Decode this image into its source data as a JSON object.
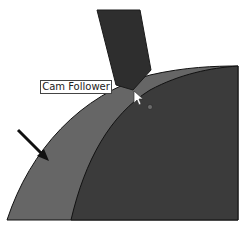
{
  "figure": {
    "tooltip_label": "Cam Follower",
    "parts": [
      {
        "name": "cam-follower",
        "shape": "slanted bar"
      },
      {
        "name": "cam-outer-band",
        "shape": "arc band"
      },
      {
        "name": "cam-body",
        "shape": "arc"
      }
    ],
    "icons": [
      "pointer-arrow",
      "mouse-cursor",
      "point-marker"
    ],
    "colors": {
      "background": "#ffffff",
      "follower": "#2e2e2e",
      "outer_band": "#666666",
      "cam_body": "#3b3b3b",
      "outline": "#111111",
      "label_border": "#444444"
    }
  }
}
